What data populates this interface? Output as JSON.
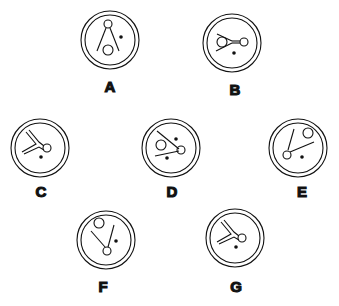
{
  "figures": [
    {
      "label": "A",
      "cx": 110,
      "cy": 40,
      "lx": 110,
      "ly": 92
    },
    {
      "label": "B",
      "cx": 232,
      "cy": 43,
      "lx": 235,
      "ly": 95
    },
    {
      "label": "C",
      "cx": 40,
      "cy": 148,
      "lx": 41,
      "ly": 197
    },
    {
      "label": "D",
      "cx": 171,
      "cy": 148,
      "lx": 172,
      "ly": 197
    },
    {
      "label": "E",
      "cx": 298,
      "cy": 148,
      "lx": 302,
      "ly": 197
    },
    {
      "label": "F",
      "cx": 106,
      "cy": 240,
      "lx": 103,
      "ly": 292
    },
    {
      "label": "G",
      "cx": 235,
      "cy": 238,
      "lx": 236,
      "ly": 292
    }
  ],
  "colors": {
    "stroke": "#111111",
    "background": "#ffffff"
  }
}
